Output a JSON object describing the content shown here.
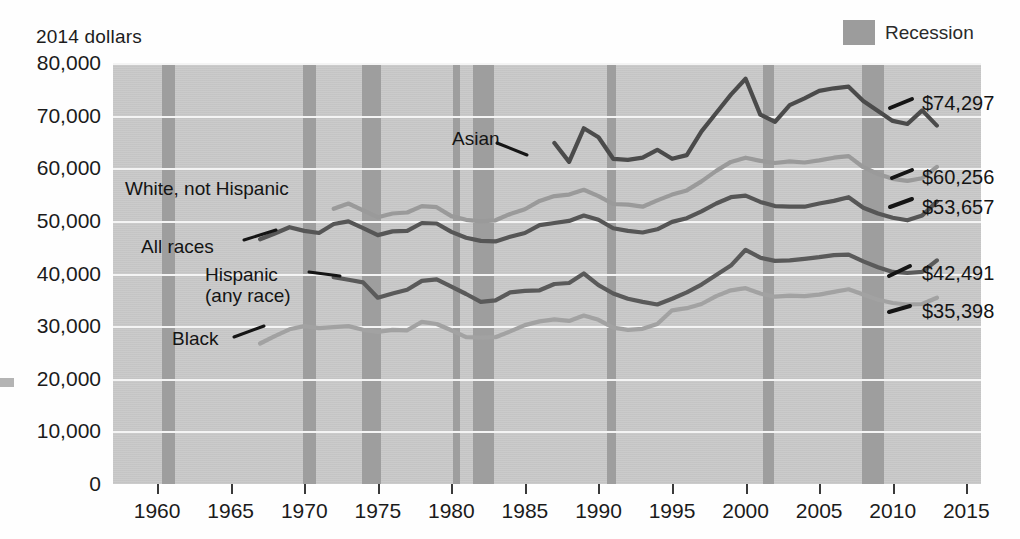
{
  "units_label": "2014 dollars",
  "legend": {
    "swatch_name": "recession-swatch",
    "label": "Recession",
    "color": "#9e9e9e"
  },
  "chart_data": {
    "type": "line",
    "title": "",
    "subtitle": "",
    "xlabel": "",
    "ylabel": "2014 dollars",
    "xlim": [
      1957,
      2016
    ],
    "ylim": [
      0,
      80000
    ],
    "grid": true,
    "legend_position": "inline-labels",
    "ytick_labels": [
      "80,000",
      "70,000",
      "60,000",
      "50,000",
      "40,000",
      "30,000",
      "20,000",
      "10,000",
      "0"
    ],
    "ytick_values": [
      80000,
      70000,
      60000,
      50000,
      40000,
      30000,
      20000,
      10000,
      0
    ],
    "xtick_labels": [
      "1960",
      "1965",
      "1970",
      "1975",
      "1980",
      "1985",
      "1990",
      "1995",
      "2000",
      "2005",
      "2010",
      "2015"
    ],
    "xtick_values": [
      1960,
      1965,
      1970,
      1975,
      1980,
      1985,
      1990,
      1995,
      2000,
      2005,
      2010,
      2015
    ],
    "recession_bands": [
      {
        "start": 1960.3,
        "end": 1961.2
      },
      {
        "start": 1969.9,
        "end": 1970.8
      },
      {
        "start": 1973.9,
        "end": 1975.2
      },
      {
        "start": 1980.1,
        "end": 1980.6
      },
      {
        "start": 1981.5,
        "end": 1982.9
      },
      {
        "start": 1990.6,
        "end": 1991.2
      },
      {
        "start": 2001.2,
        "end": 2001.9
      },
      {
        "start": 2007.9,
        "end": 2009.4
      }
    ],
    "series": [
      {
        "name": "Asian",
        "color": "#4b4b4b",
        "label_text": "Asian",
        "end_value_label": "$74,297",
        "x": [
          1987,
          1988,
          1989,
          1990,
          1991,
          1992,
          1993,
          1994,
          1995,
          1996,
          1997,
          1998,
          1999,
          2000,
          2001,
          2002,
          2003,
          2004,
          2005,
          2006,
          2007,
          2008,
          2009,
          2010,
          2011,
          2012,
          2013
        ],
        "values": [
          64800,
          61200,
          67600,
          65900,
          61800,
          61600,
          62000,
          63500,
          61800,
          62500,
          67000,
          70500,
          74000,
          77000,
          70200,
          68800,
          72000,
          73300,
          74700,
          75200,
          75500,
          72800,
          70900,
          69000,
          68400,
          71000,
          68100
        ]
      },
      {
        "name": "White, not Hispanic",
        "color": "#9a9a9a",
        "label_text": "White, not Hispanic",
        "end_value_label": "$60,256",
        "x": [
          1972,
          1973,
          1974,
          1975,
          1976,
          1977,
          1978,
          1979,
          1980,
          1981,
          1982,
          1983,
          1984,
          1985,
          1986,
          1987,
          1988,
          1989,
          1990,
          1991,
          1992,
          1993,
          1994,
          1995,
          1996,
          1997,
          1998,
          1999,
          2000,
          2001,
          2002,
          2003,
          2004,
          2005,
          2006,
          2007,
          2008,
          2009,
          2010,
          2011,
          2012,
          2013
        ],
        "values": [
          52300,
          53300,
          52000,
          50700,
          51400,
          51600,
          52800,
          52600,
          50900,
          50200,
          49900,
          50100,
          51300,
          52200,
          53800,
          54700,
          55000,
          55900,
          54700,
          53200,
          53100,
          52700,
          53900,
          55000,
          55800,
          57500,
          59500,
          61200,
          62000,
          61400,
          61000,
          61300,
          61100,
          61500,
          62000,
          62300,
          60200,
          58900,
          58000,
          57600,
          58100,
          60256
        ]
      },
      {
        "name": "All races",
        "color": "#565656",
        "label_text": "All races",
        "end_value_label": "$53,657",
        "x": [
          1967,
          1968,
          1969,
          1970,
          1971,
          1972,
          1973,
          1974,
          1975,
          1976,
          1977,
          1978,
          1979,
          1980,
          1981,
          1982,
          1983,
          1984,
          1985,
          1986,
          1987,
          1988,
          1989,
          1990,
          1991,
          1992,
          1993,
          1994,
          1995,
          1996,
          1997,
          1998,
          1999,
          2000,
          2001,
          2002,
          2003,
          2004,
          2005,
          2006,
          2007,
          2008,
          2009,
          2010,
          2011,
          2012,
          2013
        ],
        "values": [
          46500,
          47600,
          48800,
          48100,
          47700,
          49400,
          49900,
          48600,
          47300,
          48000,
          48100,
          49600,
          49500,
          47900,
          46800,
          46200,
          46100,
          47000,
          47700,
          49200,
          49600,
          50000,
          51000,
          50200,
          48600,
          48100,
          47800,
          48400,
          49800,
          50500,
          51800,
          53300,
          54500,
          54800,
          53600,
          52800,
          52700,
          52700,
          53300,
          53800,
          54500,
          52500,
          51400,
          50600,
          50100,
          51000,
          53657
        ]
      },
      {
        "name": "Hispanic (any race)",
        "color": "#5a5a5a",
        "label_text": "Hispanic\n(any race)",
        "end_value_label": "$42,491",
        "x": [
          1972,
          1973,
          1974,
          1975,
          1976,
          1977,
          1978,
          1979,
          1980,
          1981,
          1982,
          1983,
          1984,
          1985,
          1986,
          1987,
          1988,
          1989,
          1990,
          1991,
          1992,
          1993,
          1994,
          1995,
          1996,
          1997,
          1998,
          1999,
          2000,
          2001,
          2002,
          2003,
          2004,
          2005,
          2006,
          2007,
          2008,
          2009,
          2010,
          2011,
          2012,
          2013
        ],
        "values": [
          39300,
          38800,
          38300,
          35400,
          36200,
          36900,
          38600,
          38900,
          37500,
          36100,
          34600,
          34900,
          36400,
          36700,
          36800,
          38000,
          38200,
          40000,
          37800,
          36200,
          35200,
          34600,
          34100,
          35200,
          36400,
          37900,
          39700,
          41500,
          44500,
          43000,
          42400,
          42500,
          42800,
          43100,
          43500,
          43600,
          42300,
          41200,
          40300,
          40100,
          40300,
          42491
        ]
      },
      {
        "name": "Black",
        "color": "#a2a2a2",
        "label_text": "Black",
        "end_value_label": "$35,398",
        "x": [
          1967,
          1968,
          1969,
          1970,
          1971,
          1972,
          1973,
          1974,
          1975,
          1976,
          1977,
          1978,
          1979,
          1980,
          1981,
          1982,
          1983,
          1984,
          1985,
          1986,
          1987,
          1988,
          1989,
          1990,
          1991,
          1992,
          1993,
          1994,
          1995,
          1996,
          1997,
          1998,
          1999,
          2000,
          2001,
          2002,
          2003,
          2004,
          2005,
          2006,
          2007,
          2008,
          2009,
          2010,
          2011,
          2012,
          2013
        ],
        "values": [
          26700,
          28100,
          29400,
          30000,
          29600,
          29800,
          30000,
          29300,
          28900,
          29300,
          29200,
          30800,
          30400,
          29200,
          27900,
          27800,
          27900,
          29000,
          30200,
          30900,
          31300,
          31000,
          32000,
          31200,
          29700,
          29300,
          29500,
          30400,
          33000,
          33400,
          34200,
          35700,
          36800,
          37200,
          36200,
          35600,
          35800,
          35700,
          36000,
          36500,
          37000,
          36000,
          35000,
          34400,
          34100,
          34200,
          35398
        ]
      }
    ]
  },
  "left_edge_mark": "page-edge-mark"
}
